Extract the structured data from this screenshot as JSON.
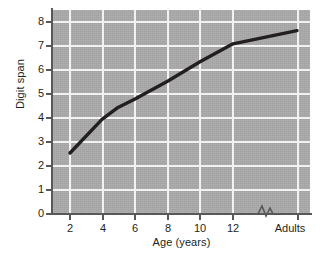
{
  "chart_data": {
    "type": "line",
    "title": "",
    "xlabel": "Age (years)",
    "ylabel": "Digit span",
    "x_tick_labels": [
      "2",
      "4",
      "6",
      "8",
      "10",
      "12",
      "Adults"
    ],
    "y_tick_labels": [
      "0",
      "1",
      "2",
      "3",
      "4",
      "5",
      "6",
      "7",
      "8"
    ],
    "ylim": [
      0,
      8.3
    ],
    "grid": true,
    "legend": null,
    "axis_break": "x-axis break between 12 and Adults",
    "categories": [
      "2",
      "4",
      "5",
      "6",
      "8",
      "10",
      "12",
      "Adults"
    ],
    "values": [
      2.5,
      3.9,
      4.4,
      4.75,
      5.5,
      6.3,
      7.05,
      7.6
    ],
    "series": [
      {
        "name": "Digit span",
        "color": "#231f20",
        "points": [
          {
            "x": "2",
            "y": 2.5
          },
          {
            "x": "4",
            "y": 3.9
          },
          {
            "x": "5",
            "y": 4.4
          },
          {
            "x": "6",
            "y": 4.75
          },
          {
            "x": "8",
            "y": 5.5
          },
          {
            "x": "10",
            "y": 6.3
          },
          {
            "x": "12",
            "y": 7.05
          },
          {
            "x": "Adults",
            "y": 7.6
          }
        ]
      }
    ]
  },
  "axes": {
    "y_title": "Digit span",
    "x_title": "Age (years)",
    "y_ticks": [
      {
        "label": "8",
        "value": 8
      },
      {
        "label": "7",
        "value": 7
      },
      {
        "label": "6",
        "value": 6
      },
      {
        "label": "5",
        "value": 5
      },
      {
        "label": "4",
        "value": 4
      },
      {
        "label": "3",
        "value": 3
      },
      {
        "label": "2",
        "value": 2
      },
      {
        "label": "1",
        "value": 1
      },
      {
        "label": "0",
        "value": 0
      }
    ],
    "x_ticks": [
      {
        "label": "2"
      },
      {
        "label": "4"
      },
      {
        "label": "6"
      },
      {
        "label": "8"
      },
      {
        "label": "10"
      },
      {
        "label": "12"
      },
      {
        "label": "Adults"
      }
    ]
  },
  "style": {
    "panel_background": "#a8a8a8",
    "gridline_color": "#f2f2f2",
    "axis_color": "#58585a",
    "line_color": "#231f20",
    "text_color": "#231f20",
    "page_background": "#ffffff"
  }
}
